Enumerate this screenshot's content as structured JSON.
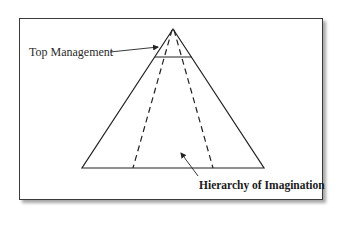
{
  "diagram": {
    "type": "pyramid",
    "labels": {
      "top": "Top Management",
      "bottom": "Hierarchy of Imagination"
    },
    "colors": {
      "line": "#222222",
      "frame": "#3a3a3a",
      "background": "#ffffff"
    }
  }
}
